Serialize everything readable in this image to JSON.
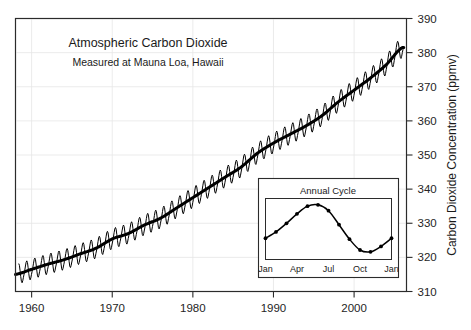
{
  "chart_data": {
    "type": "line",
    "title": "Atmospheric Carbon Dioxide",
    "subtitle": "Measured at Mauna Loa, Hawaii",
    "xlabel": "",
    "ylabel": "Carbon Dioxide Concentration (ppmv)",
    "ylabel_side": "right",
    "xlim": [
      1958,
      2006.5
    ],
    "ylim": [
      310,
      390
    ],
    "grid": true,
    "legend": "none",
    "yticks": [
      310,
      320,
      330,
      340,
      350,
      360,
      370,
      380,
      390
    ],
    "xticks": [
      1960,
      1970,
      1980,
      1990,
      2000
    ],
    "xtick_labels": [
      "1960",
      "1970",
      "1980",
      "1990",
      "2000"
    ],
    "ytick_labels": [
      "310",
      "320",
      "330",
      "340",
      "350",
      "360",
      "370",
      "380",
      "390"
    ],
    "series": [
      {
        "name": "Monthly mean CO2 (with seasonal cycle)",
        "style": "sawtooth-thin",
        "x": [
          1958.5,
          1959.0,
          1959.5,
          1960.0,
          1960.5,
          1961.0,
          1961.5,
          1962.0,
          1962.5,
          1963.0,
          1963.5,
          1964.0,
          1964.5,
          1965.0,
          1965.5,
          1966.0,
          1966.5,
          1967.0,
          1967.5,
          1968.0,
          1968.5,
          1969.0,
          1969.5,
          1970.0,
          1970.5,
          1971.0,
          1971.5,
          1972.0,
          1972.5,
          1973.0,
          1973.5,
          1974.0,
          1974.5,
          1975.0,
          1975.5,
          1976.0,
          1976.5,
          1977.0,
          1977.5,
          1978.0,
          1978.5,
          1979.0,
          1979.5,
          1980.0,
          1980.5,
          1981.0,
          1981.5,
          1982.0,
          1982.5,
          1983.0,
          1983.5,
          1984.0,
          1984.5,
          1985.0,
          1985.5,
          1986.0,
          1986.5,
          1987.0,
          1987.5,
          1988.0,
          1988.5,
          1989.0,
          1989.5,
          1990.0,
          1990.5,
          1991.0,
          1991.5,
          1992.0,
          1992.5,
          1993.0,
          1993.5,
          1994.0,
          1994.5,
          1995.0,
          1995.5,
          1996.0,
          1996.5,
          1997.0,
          1997.5,
          1998.0,
          1998.5,
          1999.0,
          1999.5,
          2000.0,
          2000.5,
          2001.0,
          2001.5,
          2002.0,
          2002.5,
          2003.0,
          2003.5,
          2004.0,
          2004.5,
          2005.0,
          2005.5,
          2006.0
        ],
        "annual_amplitude_ppmv": 6.0
      },
      {
        "name": "Smoothed trend",
        "style": "thick-line",
        "x": [
          1958,
          1960,
          1962,
          1964,
          1966,
          1968,
          1970,
          1972,
          1974,
          1976,
          1978,
          1980,
          1982,
          1984,
          1986,
          1988,
          1990,
          1992,
          1994,
          1996,
          1998,
          2000,
          2002,
          2004,
          2006
        ],
        "values": [
          315.0,
          316.5,
          318.0,
          319.3,
          321.0,
          322.7,
          325.4,
          327.0,
          329.5,
          331.5,
          334.5,
          337.5,
          340.5,
          343.5,
          346.5,
          350.5,
          353.5,
          356.0,
          358.5,
          361.5,
          365.5,
          369.0,
          372.5,
          376.5,
          381.5
        ]
      }
    ],
    "inset": {
      "title": "Annual Cycle",
      "type": "line",
      "xtick_labels": [
        "Jan",
        "Apr",
        "Jul",
        "Oct",
        "Jan"
      ],
      "categories": [
        "Jan",
        "Feb",
        "Mar",
        "Apr",
        "May",
        "Jun",
        "Jul",
        "Aug",
        "Sep",
        "Oct",
        "Nov",
        "Dec",
        "Jan"
      ],
      "values": [
        328.2,
        329.6,
        331.5,
        333.6,
        335.3,
        335.6,
        334.3,
        331.2,
        328.0,
        325.6,
        325.2,
        326.4,
        328.2
      ],
      "ylim": [
        323.5,
        337.0
      ],
      "grid": false,
      "marker": "circle"
    }
  },
  "colors": {
    "background": "#ffffff",
    "frame": "#2b2b2b",
    "grid": "#e2e2e2",
    "data_line": "#000000",
    "text": "#1a1a1a"
  }
}
